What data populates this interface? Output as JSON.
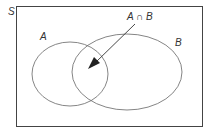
{
  "diagram": {
    "type": "venn",
    "universe_label": "S",
    "sets": [
      {
        "label": "A"
      },
      {
        "label": "B"
      }
    ],
    "intersection_label": "A ∩ B",
    "colors": {
      "stroke": "#555555",
      "text": "#333333",
      "background": "#ffffff"
    }
  }
}
